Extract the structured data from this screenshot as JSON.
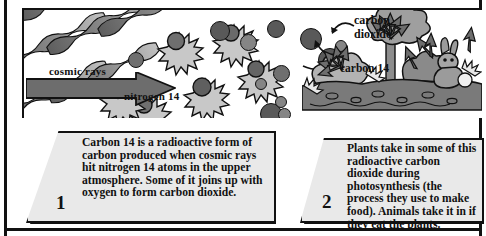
{
  "figure": {
    "colors": {
      "ink": "#111111",
      "ray_dark": "#6a6a6a",
      "ray_light": "#b0b0b0",
      "atom_fill": "#6f6f6f",
      "arrow_fill": "#6d6d6d",
      "box_fill": "#e9e9e9",
      "foliage": "#9a9a9a",
      "soil": "#7a7a7a"
    }
  },
  "illustration": {
    "labels": [
      {
        "id": "cosmic-rays",
        "text": "cosmic rays"
      },
      {
        "id": "nitrogen-14",
        "text": "nitrogen 14"
      },
      {
        "id": "carbon-dioxide",
        "line1": "carbon",
        "line2": "dioxide"
      },
      {
        "id": "carbon-14",
        "text": "carbon 14"
      }
    ],
    "scene_elements": [
      "cosmic ray streaks",
      "nitrogen 14 atoms",
      "carbon 14 atoms",
      "carbon dioxide molecules",
      "large transition arrow",
      "tree",
      "bushes",
      "soil",
      "rabbit",
      "radiation arrows"
    ]
  },
  "captions": [
    {
      "number": "1",
      "text": "Carbon 14 is a radioactive form of carbon produced when cosmic rays hit nitrogen 14 atoms in the upper atmosphere. Some of it joins up with oxygen to form carbon dioxide."
    },
    {
      "number": "2",
      "text": "Plants take in some of this radioactive carbon dioxide during photosynthesis (the process they use to make food). Animals take it in if they eat the plants."
    }
  ]
}
